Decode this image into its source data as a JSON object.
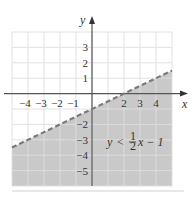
{
  "chart_data": {
    "type": "line",
    "title": "",
    "xlabel": "x",
    "ylabel": "y",
    "xlim": [
      -5,
      5
    ],
    "ylim": [
      -6,
      4
    ],
    "grid": true,
    "x_ticks": [
      "-4",
      "-3",
      "-2",
      "-1",
      "2",
      "3",
      "4"
    ],
    "y_ticks": [
      "3",
      "2",
      "1",
      "-2",
      "-3",
      "-4",
      "-5"
    ],
    "series": [
      {
        "name": "boundary y = 1/2 x - 1",
        "style": "dashed",
        "x": [
          -5,
          5
        ],
        "y": [
          -3.5,
          1.5
        ]
      }
    ],
    "shaded_region": "below boundary line",
    "annotation": "y < 1/2 x - 1",
    "colors": {
      "shade": "#c9c9c9",
      "grid": "#e2e2e2",
      "axis": "#555555",
      "boundary": "#7a7a7a"
    }
  },
  "labels": {
    "x_axis": "x",
    "y_axis": "y",
    "ineq_y": "y",
    "ineq_lt": "<",
    "ineq_num": "1",
    "ineq_den": "2",
    "ineq_rest": "x − 1"
  }
}
